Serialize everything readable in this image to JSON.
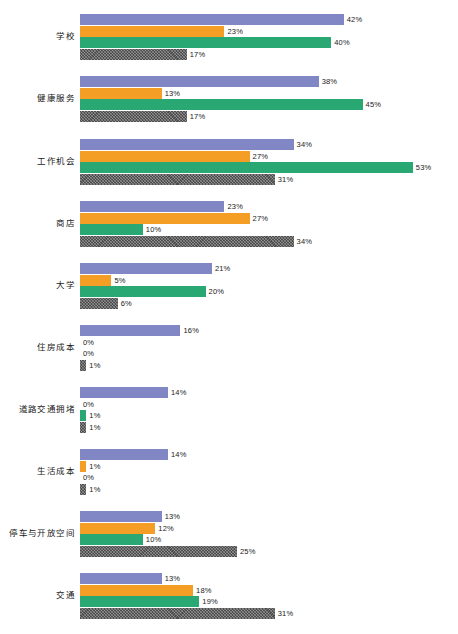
{
  "chart_data": {
    "type": "bar",
    "orientation": "horizontal",
    "title": "",
    "subtitle": "",
    "xlabel": "",
    "ylabel": "",
    "xlim": [
      0,
      55
    ],
    "grid": false,
    "legend": "none",
    "value_suffix": "%",
    "px_per_unit": 6.28,
    "bar_origin_x": 80,
    "colors": {
      "series_1": "#8186c4",
      "series_2": "#f59e26",
      "series_3": "#2aa873",
      "series_4": "#4d4d4d",
      "background": "#ffffff",
      "text": "#1a1a1a"
    },
    "categories": [
      "学校",
      "健康服务",
      "工作机会",
      "商店",
      "大学",
      "住房成本",
      "道路交通拥堵",
      "生活成本",
      "停车与开放空间",
      "交通"
    ],
    "series": [
      {
        "name": "series_1",
        "values": [
          42,
          38,
          34,
          23,
          21,
          16,
          14,
          14,
          13,
          13
        ]
      },
      {
        "name": "series_2",
        "values": [
          23,
          13,
          27,
          27,
          5,
          0,
          0,
          1,
          12,
          18
        ]
      },
      {
        "name": "series_3",
        "values": [
          40,
          45,
          53,
          10,
          20,
          0,
          1,
          0,
          10,
          19
        ]
      },
      {
        "name": "series_4",
        "values": [
          17,
          17,
          31,
          34,
          6,
          1,
          1,
          1,
          25,
          31
        ]
      }
    ],
    "data_labels": [
      {
        "category": "学校",
        "labels": [
          "42%",
          "23%",
          "40%",
          "17%"
        ]
      },
      {
        "category": "健康服务",
        "labels": [
          "38%",
          "13%",
          "45%",
          "17%"
        ]
      },
      {
        "category": "工作机会",
        "labels": [
          "34%",
          "27%",
          "53%",
          "31%"
        ]
      },
      {
        "category": "商店",
        "labels": [
          "23%",
          "27%",
          "10%",
          "34%"
        ]
      },
      {
        "category": "大学",
        "labels": [
          "21%",
          "5%",
          "20%",
          "6%"
        ]
      },
      {
        "category": "住房成本",
        "labels": [
          "16%",
          "0%",
          "0%",
          "1%"
        ]
      },
      {
        "category": "道路交通拥堵",
        "labels": [
          "14%",
          "0%",
          "1%",
          "1%"
        ]
      },
      {
        "category": "生活成本",
        "labels": [
          "14%",
          "1%",
          "0%",
          "1%"
        ]
      },
      {
        "category": "停车与开放空间",
        "labels": [
          "13%",
          "12%",
          "10%",
          "25%"
        ]
      },
      {
        "category": "交通",
        "labels": [
          "13%",
          "18%",
          "19%",
          "31%"
        ]
      }
    ]
  },
  "layout": {
    "group_tops": [
      14,
      76,
      139,
      201,
      263,
      325,
      387,
      449,
      511,
      573
    ],
    "bar_height": 11,
    "row_pitch": 11.5
  }
}
